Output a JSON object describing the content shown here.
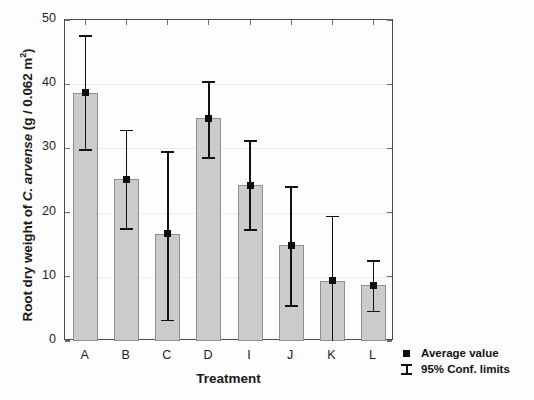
{
  "chart_data": {
    "type": "bar",
    "title": "",
    "xlabel": "Treatment",
    "ylabel": "Root dry weight of C. arvense (g / 0.062 m²)",
    "ylabel_parts": {
      "before_italic": "Root dry weight of ",
      "italic": "C. arvense",
      "after_italic": " (g / 0.062 m",
      "superscript": "2",
      "tail": ")"
    },
    "categories": [
      "A",
      "B",
      "C",
      "D",
      "I",
      "J",
      "K",
      "L"
    ],
    "values": [
      38.7,
      25.2,
      16.7,
      34.7,
      24.3,
      14.9,
      9.4,
      8.7
    ],
    "ci_lower": [
      29.9,
      17.6,
      3.3,
      28.6,
      17.4,
      5.6,
      0.0,
      4.7
    ],
    "ci_upper": [
      47.6,
      32.9,
      29.6,
      40.5,
      31.3,
      24.1,
      19.5,
      12.6
    ],
    "ylim": [
      0,
      50
    ],
    "yticks": [
      0,
      10,
      20,
      30,
      40,
      50
    ],
    "ytick_labels": [
      "0",
      "10",
      "20",
      "30",
      "40",
      "50"
    ],
    "grid": true,
    "grid_axis": "y",
    "legend_position": "outside-bottom-right",
    "series": [
      {
        "name": "Average value",
        "values": [
          38.7,
          25.2,
          16.7,
          34.7,
          24.3,
          14.9,
          9.4,
          8.7
        ]
      }
    ],
    "legend": [
      {
        "label": "Average value",
        "symbol": "filled-square-marker"
      },
      {
        "label": "95% Conf. limits",
        "symbol": "i-beam-error-bar"
      }
    ],
    "colors": {
      "bar_fill": "#cbcbcb",
      "bar_edge": "#8f8f8f",
      "error_bar": "#111111",
      "marker": "#0d0d0d",
      "axis": "#4a4a4a",
      "grid": "#ededed",
      "text": "#1a1a1a",
      "background": "#ffffff"
    }
  }
}
